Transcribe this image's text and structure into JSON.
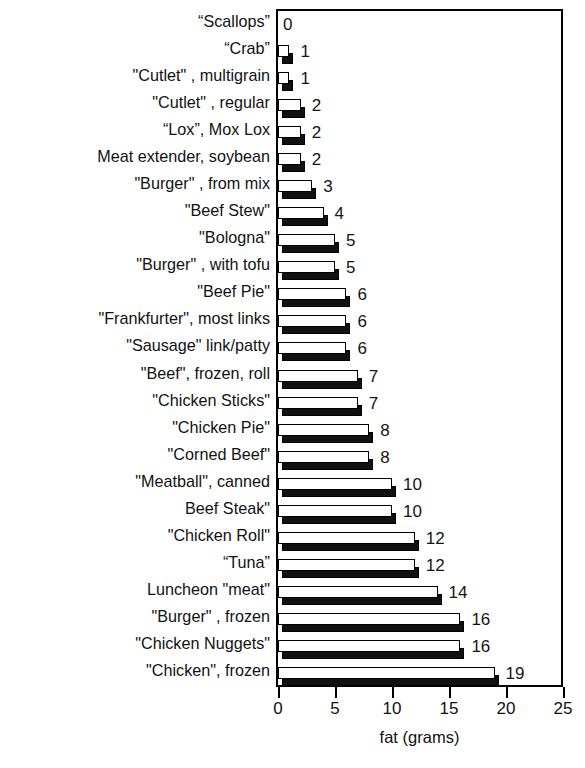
{
  "chart_title": "VEGETARIAN CHOICES",
  "axis": {
    "x_label": "fat (grams)",
    "x_ticks": [
      0,
      5,
      10,
      15,
      20,
      25
    ],
    "x_tick_labels": [
      "0",
      "5",
      "10",
      "15",
      "20",
      "25"
    ],
    "x_min": 0,
    "x_max": 25
  },
  "chart_data": {
    "type": "bar",
    "orientation": "horizontal",
    "title": "VEGETARIAN CHOICES",
    "xlabel": "fat (grams)",
    "ylabel": "",
    "xlim": [
      0,
      25
    ],
    "grid": false,
    "legend": "none",
    "data_labels": true,
    "categories": [
      "“Scallops”",
      "“Crab”",
      "\"Cutlet\" , multigrain",
      "\"Cutlet\" , regular",
      "“Lox”, Mox Lox",
      "Meat extender, soybean",
      "\"Burger\" , from mix",
      "\"Beef Stew\"",
      "\"Bologna\"",
      "\"Burger\" , with tofu",
      "\"Beef Pie\"",
      "\"Frankfurter\", most links",
      "\"Sausage\" link/patty",
      "\"Beef\", frozen, roll",
      "\"Chicken Sticks\"",
      "\"Chicken Pie\"",
      "\"Corned Beef\"",
      "\"Meatball\", canned",
      "Beef Steak\"",
      "\"Chicken Roll\"",
      "“Tuna”",
      "Luncheon \"meat\"",
      "\"Burger\" , frozen",
      "\"Chicken Nuggets\"",
      "\"Chicken\", frozen"
    ],
    "values": [
      0,
      1,
      1,
      2,
      2,
      2,
      3,
      4,
      5,
      5,
      6,
      6,
      6,
      7,
      7,
      8,
      8,
      10,
      10,
      12,
      12,
      14,
      16,
      16,
      19
    ],
    "value_labels": [
      "0",
      "1",
      "1",
      "2",
      "2",
      "2",
      "3",
      "4",
      "5",
      "5",
      "6",
      "6",
      "6",
      "7",
      "7",
      "8",
      "8",
      "10",
      "10",
      "12",
      "12",
      "14",
      "16",
      "16",
      "19"
    ]
  },
  "colors": {
    "bar_face": "#ffffff",
    "bar_shadow": "#111111",
    "outline": "#000000",
    "background": "#ffffff",
    "text": "#111111"
  }
}
